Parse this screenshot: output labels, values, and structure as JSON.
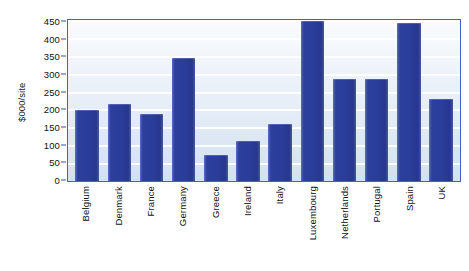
{
  "chart_data": {
    "type": "bar",
    "title": "",
    "xlabel": "",
    "ylabel": "$000/site",
    "ylim": [
      0,
      450
    ],
    "ytick_step": 50,
    "grid": true,
    "legend": false,
    "bar_color": "#2b3d9a",
    "plot_border_color": "#4a5fc1",
    "categories": [
      "Belgium",
      "Denmark",
      "France",
      "Germany",
      "Greece",
      "Ireland",
      "Italy",
      "Luxembourg",
      "Netherlands",
      "Portugal",
      "Spain",
      "UK"
    ],
    "values": [
      198,
      215,
      188,
      343,
      72,
      112,
      160,
      447,
      284,
      284,
      443,
      228
    ],
    "yticks": [
      {
        "label": "450",
        "value": 450
      },
      {
        "label": "400",
        "value": 400
      },
      {
        "label": "350",
        "value": 350
      },
      {
        "label": "300",
        "value": 300
      },
      {
        "label": "250",
        "value": 250
      },
      {
        "label": "200",
        "value": 200
      },
      {
        "label": "150",
        "value": 150
      },
      {
        "label": "100",
        "value": 100
      },
      {
        "label": "50",
        "value": 50
      },
      {
        "label": "0",
        "value": 0
      }
    ]
  },
  "cropped_title": ""
}
